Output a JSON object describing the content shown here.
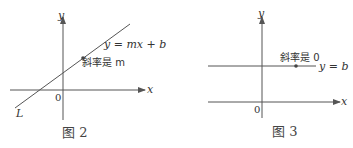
{
  "figures": [
    {
      "caption": "图 2",
      "x_axis_label": "x",
      "y_axis_label": "y",
      "origin_label": "0",
      "line_equation": "y = mx + b",
      "slope_label": "斜率是 m",
      "line_name": "L"
    },
    {
      "caption": "图 3",
      "x_axis_label": "x",
      "y_axis_label": "y",
      "origin_label": "0",
      "line_equation": "y = b",
      "slope_label": "斜率是 0"
    }
  ],
  "colors": {
    "stroke": "#555555",
    "text": "#333333"
  }
}
